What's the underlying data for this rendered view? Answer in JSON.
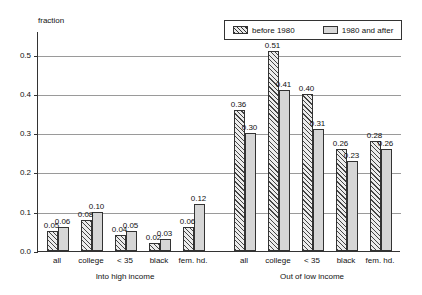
{
  "chart_data": {
    "type": "bar",
    "title": "",
    "xlabel": "",
    "ylabel": "fraction",
    "ylim": [
      0.0,
      0.56
    ],
    "yticks": [
      "0.0",
      "0.1",
      "0.2",
      "0.3",
      "0.4",
      "0.5"
    ],
    "ytick_values": [
      0.0,
      0.1,
      0.2,
      0.3,
      0.4,
      0.5
    ],
    "grid": true,
    "legend_position": "top-right",
    "legend": [
      "before 1980",
      "1980 and after"
    ],
    "categories": [
      "all",
      "college",
      "< 35",
      "black",
      "fem. hd."
    ],
    "panels": [
      {
        "title": "Into high income",
        "series": [
          {
            "name": "before 1980",
            "values": [
              0.05,
              0.08,
              0.04,
              0.02,
              0.06
            ],
            "labels": [
              "0.05",
              "0.08",
              "0.04",
              "0.02",
              "0.06"
            ]
          },
          {
            "name": "1980 and after",
            "values": [
              0.06,
              0.1,
              0.05,
              0.03,
              0.12
            ],
            "labels": [
              "0.06",
              "0.10",
              "0.05",
              "0.03",
              "0.12"
            ]
          }
        ]
      },
      {
        "title": "Out of low income",
        "series": [
          {
            "name": "before 1980",
            "values": [
              0.36,
              0.51,
              0.4,
              0.26,
              0.28
            ],
            "labels": [
              "0.36",
              "0.51",
              "0.40",
              "0.26",
              "0.28"
            ]
          },
          {
            "name": "1980 and after",
            "values": [
              0.3,
              0.41,
              0.31,
              0.23,
              0.26
            ],
            "labels": [
              "0.30",
              "0.41",
              "0.31",
              "0.23",
              "0.26"
            ]
          }
        ]
      }
    ]
  },
  "colors": {
    "axis": "#333333",
    "grid": "#9a9a9a",
    "hatch_fill": "#ececec",
    "solid_fill": "#d6d6d6",
    "text": "#111111",
    "background": "#ffffff"
  }
}
